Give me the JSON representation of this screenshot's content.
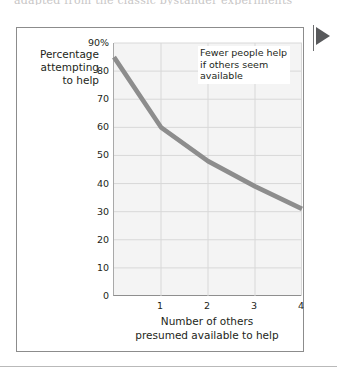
{
  "figure": {
    "clipped_top_text": "adapted from the classic bystander experiments",
    "marker_triangle": "right-pointing-triangle"
  },
  "chart_data": {
    "type": "line",
    "title": "",
    "subtitle": "",
    "xlabel": "Number of others presumed available to help",
    "xlabel_lines": [
      "Number of others",
      "presumed available to help"
    ],
    "ylabel": "Percentage attempting to help",
    "ylabel_lines": [
      "Percentage",
      "attempting",
      "to help"
    ],
    "x": [
      0,
      1,
      2,
      3,
      4
    ],
    "values": [
      85,
      60,
      48,
      39,
      31
    ],
    "series": [
      {
        "name": "Percentage attempting to help",
        "values": [
          85,
          60,
          48,
          39,
          31
        ],
        "color": "#8d8d8d"
      }
    ],
    "xlim": [
      0,
      4
    ],
    "ylim": [
      0,
      90
    ],
    "xticks": [
      1,
      2,
      3,
      4
    ],
    "xtick_labels": [
      "1",
      "2",
      "3",
      "4"
    ],
    "yticks": [
      0,
      10,
      20,
      30,
      40,
      50,
      60,
      70,
      80,
      90
    ],
    "ytick_labels": [
      "0",
      "10",
      "20",
      "30",
      "40",
      "50",
      "60",
      "70",
      "80",
      "90%"
    ],
    "grid": true,
    "legend": "none",
    "annotations": [
      {
        "lines": [
          "Fewer people help",
          "if others seem",
          "available"
        ],
        "text": "Fewer people help if others seem available"
      }
    ],
    "plot_background": "#f4f4f4",
    "grid_color": "#d8d8d8",
    "axis_color": "#8e8e8e"
  }
}
